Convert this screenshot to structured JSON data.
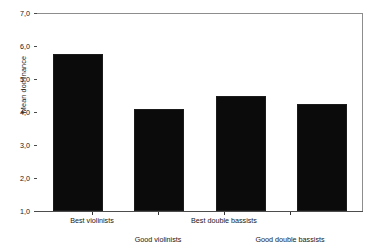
{
  "chart_data": {
    "type": "bar",
    "title": "",
    "subtitle": "",
    "xlabel": "",
    "ylabel": "Mean dominance",
    "categories": [
      "Best violinists",
      "Good violinists",
      "Best double bassists",
      "Good double bassists"
    ],
    "values": [
      5.75,
      4.1,
      4.5,
      4.25
    ],
    "ylim": [
      1.0,
      7.0
    ],
    "y_ticks": [
      1.0,
      2.0,
      3.0,
      4.0,
      5.0,
      6.0,
      7.0
    ],
    "y_tick_labels": [
      "1,0",
      "2,0",
      "3,0",
      "4,0",
      "5,0",
      "6,0",
      "7,0"
    ],
    "decimal_separator": ",",
    "grid": false,
    "legend": false,
    "legend_position": "none",
    "bar_color": "#0b0b0b",
    "axis_color": "#6e6e6e",
    "background_color": "#ffffff",
    "label_layout": "staggered-two-rows"
  },
  "axes": {
    "y_title": "Mean dominance"
  }
}
